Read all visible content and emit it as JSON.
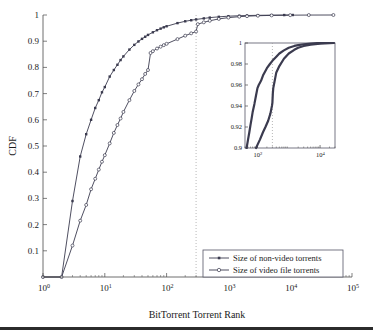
{
  "chart_data": {
    "type": "line",
    "title": "",
    "subtitle": "",
    "xlabel": "BitTorrent Torrent Rank",
    "ylabel": "CDF",
    "xscale": "log",
    "yscale": "linear",
    "xlim": [
      1,
      100000
    ],
    "ylim": [
      0,
      1
    ],
    "grid": false,
    "legend_position": "bottom-right",
    "annotations": [
      {
        "name": "vertical-reference-line",
        "type": "vline",
        "x": 300,
        "style": "dotted"
      }
    ],
    "xticks": [
      {
        "value": 1,
        "label": "10",
        "exponent": "0"
      },
      {
        "value": 10,
        "label": "10",
        "exponent": "1"
      },
      {
        "value": 100,
        "label": "10",
        "exponent": "2"
      },
      {
        "value": 1000,
        "label": "10",
        "exponent": "3"
      },
      {
        "value": 10000,
        "label": "10",
        "exponent": "4"
      },
      {
        "value": 100000,
        "label": "10",
        "exponent": "5"
      }
    ],
    "yticks": [
      {
        "value": 0.1,
        "label": "0.1"
      },
      {
        "value": 0.2,
        "label": "0.2"
      },
      {
        "value": 0.3,
        "label": "0.3"
      },
      {
        "value": 0.4,
        "label": "0.4"
      },
      {
        "value": 0.5,
        "label": "0.5"
      },
      {
        "value": 0.6,
        "label": "0.6"
      },
      {
        "value": 0.7,
        "label": "0.7"
      },
      {
        "value": 0.8,
        "label": "0.8"
      },
      {
        "value": 0.9,
        "label": "0.9"
      },
      {
        "value": 1.0,
        "label": "1"
      }
    ],
    "series": [
      {
        "name": "Size of non-video torrents",
        "marker": "filled-square",
        "color": "#3b3b4f",
        "points": [
          [
            1,
            0.0
          ],
          [
            2,
            0.0
          ],
          [
            3,
            0.29
          ],
          [
            4,
            0.46
          ],
          [
            5,
            0.545
          ],
          [
            6,
            0.6
          ],
          [
            7,
            0.645
          ],
          [
            8,
            0.675
          ],
          [
            9,
            0.705
          ],
          [
            10,
            0.725
          ],
          [
            12,
            0.765
          ],
          [
            14,
            0.79
          ],
          [
            16,
            0.81
          ],
          [
            18,
            0.828
          ],
          [
            20,
            0.842
          ],
          [
            25,
            0.868
          ],
          [
            30,
            0.886
          ],
          [
            35,
            0.899
          ],
          [
            40,
            0.909
          ],
          [
            45,
            0.917
          ],
          [
            50,
            0.924
          ],
          [
            60,
            0.934
          ],
          [
            70,
            0.942
          ],
          [
            80,
            0.948
          ],
          [
            90,
            0.953
          ],
          [
            100,
            0.957
          ],
          [
            150,
            0.969
          ],
          [
            200,
            0.976
          ],
          [
            250,
            0.98
          ],
          [
            300,
            0.983
          ],
          [
            400,
            0.987
          ],
          [
            500,
            0.99
          ],
          [
            700,
            0.993
          ],
          [
            1000,
            0.9955
          ],
          [
            1500,
            0.9972
          ],
          [
            2000,
            0.998
          ],
          [
            3000,
            0.9988
          ],
          [
            5000,
            0.9994
          ],
          [
            8000,
            0.9998
          ],
          [
            11000,
            1.0
          ]
        ]
      },
      {
        "name": "Size of video file torrents",
        "marker": "open-circle",
        "color": "#3b3b4f",
        "points": [
          [
            1,
            0.0
          ],
          [
            2,
            0.0
          ],
          [
            3,
            0.12
          ],
          [
            4,
            0.215
          ],
          [
            5,
            0.275
          ],
          [
            6,
            0.335
          ],
          [
            7,
            0.375
          ],
          [
            8,
            0.41
          ],
          [
            9,
            0.44
          ],
          [
            10,
            0.465
          ],
          [
            12,
            0.51
          ],
          [
            14,
            0.55
          ],
          [
            16,
            0.58
          ],
          [
            18,
            0.605
          ],
          [
            20,
            0.63
          ],
          [
            25,
            0.675
          ],
          [
            30,
            0.71
          ],
          [
            35,
            0.735
          ],
          [
            40,
            0.755
          ],
          [
            45,
            0.775
          ],
          [
            50,
            0.79
          ],
          [
            55,
            0.855
          ],
          [
            60,
            0.862
          ],
          [
            70,
            0.872
          ],
          [
            80,
            0.879
          ],
          [
            90,
            0.885
          ],
          [
            100,
            0.89
          ],
          [
            150,
            0.908
          ],
          [
            200,
            0.921
          ],
          [
            250,
            0.93
          ],
          [
            300,
            0.937
          ],
          [
            320,
            0.965
          ],
          [
            400,
            0.972
          ],
          [
            500,
            0.978
          ],
          [
            700,
            0.985
          ],
          [
            1000,
            0.99
          ],
          [
            1500,
            0.9935
          ],
          [
            2000,
            0.9955
          ],
          [
            3000,
            0.9972
          ],
          [
            5000,
            0.9985
          ],
          [
            10000,
            0.9994
          ],
          [
            20000,
            0.9998
          ],
          [
            50000,
            1.0
          ]
        ]
      }
    ],
    "inset": {
      "xlim": [
        40,
        30000
      ],
      "ylim": [
        0.9,
        1.0
      ],
      "xscale": "log",
      "xticks": [
        {
          "value": 100,
          "label": "10",
          "exponent": "2"
        },
        {
          "value": 10000,
          "label": "10",
          "exponent": "4"
        }
      ],
      "yticks": [
        {
          "value": 0.9,
          "label": "0.9"
        },
        {
          "value": 0.92,
          "label": "0.92"
        },
        {
          "value": 0.94,
          "label": "0.94"
        },
        {
          "value": 0.96,
          "label": "0.96"
        },
        {
          "value": 0.98,
          "label": "0.98"
        },
        {
          "value": 1.0,
          "label": "1"
        }
      ],
      "annotations": [
        {
          "name": "vertical-reference-line",
          "type": "vline",
          "x": 300,
          "style": "dotted"
        }
      ],
      "series": [
        {
          "name": "Size of non-video torrents",
          "points": [
            [
              45,
              0.9
            ],
            [
              50,
              0.908
            ],
            [
              55,
              0.915
            ],
            [
              60,
              0.922
            ],
            [
              65,
              0.928
            ],
            [
              70,
              0.934
            ],
            [
              80,
              0.942
            ],
            [
              90,
              0.95
            ],
            [
              100,
              0.957
            ],
            [
              110,
              0.96
            ],
            [
              130,
              0.964
            ],
            [
              150,
              0.969
            ],
            [
              200,
              0.976
            ],
            [
              250,
              0.98
            ],
            [
              300,
              0.983
            ],
            [
              400,
              0.987
            ],
            [
              500,
              0.99
            ],
            [
              700,
              0.993
            ],
            [
              1000,
              0.9955
            ],
            [
              1500,
              0.9972
            ],
            [
              2000,
              0.998
            ],
            [
              3000,
              0.9988
            ],
            [
              5000,
              0.9994
            ],
            [
              8000,
              0.9998
            ],
            [
              11000,
              1.0
            ],
            [
              20000,
              1.0
            ]
          ]
        },
        {
          "name": "Size of video file torrents",
          "points": [
            [
              90,
              0.9
            ],
            [
              100,
              0.903
            ],
            [
              120,
              0.908
            ],
            [
              150,
              0.915
            ],
            [
              180,
              0.92
            ],
            [
              220,
              0.926
            ],
            [
              260,
              0.933
            ],
            [
              290,
              0.94
            ],
            [
              300,
              0.943
            ],
            [
              310,
              0.952
            ],
            [
              320,
              0.957
            ],
            [
              350,
              0.963
            ],
            [
              400,
              0.972
            ],
            [
              500,
              0.978
            ],
            [
              700,
              0.985
            ],
            [
              1000,
              0.99
            ],
            [
              1500,
              0.9935
            ],
            [
              2000,
              0.9955
            ],
            [
              3000,
              0.9972
            ],
            [
              5000,
              0.9985
            ],
            [
              10000,
              0.9994
            ],
            [
              20000,
              0.9998
            ],
            [
              28000,
              1.0
            ]
          ]
        }
      ]
    },
    "legend": [
      {
        "label": "Size of non-video torrents",
        "marker": "filled-square"
      },
      {
        "label": "Size of video file torrents",
        "marker": "open-circle"
      }
    ]
  }
}
